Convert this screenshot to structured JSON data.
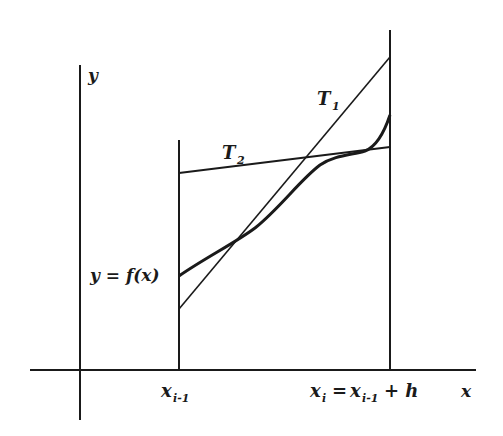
{
  "diagram": {
    "type": "function-tangent-illustration",
    "axes": {
      "x_label": "x",
      "y_label": "y"
    },
    "curve_label": "y = f(x)",
    "tangents": [
      {
        "name": "T",
        "subscript": "1"
      },
      {
        "name": "T",
        "subscript": "2"
      }
    ],
    "interval": {
      "left": {
        "base": "x",
        "subscript": "i-1"
      },
      "right": {
        "base": "x",
        "subscript": "i",
        "rhs_base": "x",
        "rhs_subscript": "i-1",
        "rhs_tail": "+ h"
      }
    },
    "colors": {
      "ink": "#1a1a1a",
      "background": "#ffffff"
    }
  }
}
